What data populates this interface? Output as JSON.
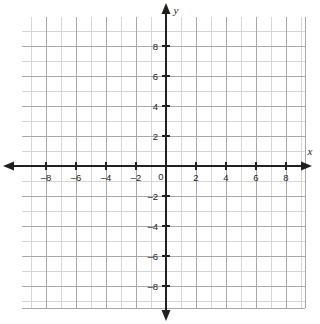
{
  "figure": {
    "kind": "cartesian-coordinate-plane",
    "background_color": "#ffffff",
    "axis_color": "#231f20",
    "grid_minor_color": "#d6d6d6",
    "grid_major_color": "#a8a8a8"
  },
  "axes": {
    "x_axis_name": "x",
    "y_axis_name": "y",
    "origin_label": "0"
  },
  "chart_data": {
    "type": "scatter",
    "title": "",
    "subtitle": "",
    "xlabel": "x",
    "ylabel": "y",
    "xlim": [
      -9.6,
      9.3
    ],
    "ylim": [
      -9.5,
      9.9
    ],
    "grid": true,
    "grid_step": 1,
    "tick_step": 2,
    "legend": "none",
    "series": [],
    "x_tick_labels": [
      "–8",
      "–6",
      "–4",
      "–2",
      "0",
      "2",
      "4",
      "6",
      "8"
    ],
    "x_tick_values": [
      -8,
      -6,
      -4,
      -2,
      0,
      2,
      4,
      6,
      8
    ],
    "y_tick_labels": [
      "8",
      "6",
      "4",
      "2",
      "–2",
      "–4",
      "–6",
      "–8"
    ],
    "y_tick_values": [
      8,
      6,
      4,
      2,
      -2,
      -4,
      -6,
      -8
    ],
    "annotations": []
  },
  "ticks": {
    "x": [
      {
        "value": -8,
        "label": "–8"
      },
      {
        "value": -6,
        "label": "–6"
      },
      {
        "value": -4,
        "label": "–4"
      },
      {
        "value": -2,
        "label": "–2"
      },
      {
        "value": 2,
        "label": "2"
      },
      {
        "value": 4,
        "label": "4"
      },
      {
        "value": 6,
        "label": "6"
      },
      {
        "value": 8,
        "label": "8"
      }
    ],
    "y": [
      {
        "value": 8,
        "label": "8"
      },
      {
        "value": 6,
        "label": "6"
      },
      {
        "value": 4,
        "label": "4"
      },
      {
        "value": 2,
        "label": "2"
      },
      {
        "value": -2,
        "label": "–2"
      },
      {
        "value": -4,
        "label": "–4"
      },
      {
        "value": -6,
        "label": "–6"
      },
      {
        "value": -8,
        "label": "–8"
      }
    ]
  }
}
